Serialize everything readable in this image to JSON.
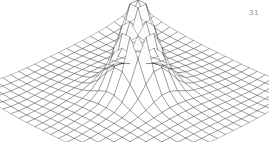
{
  "page": {
    "number": "31",
    "background_color": "#ffffff"
  },
  "figure": {
    "caption": "",
    "line_color": "#1a1a1a",
    "surface_fill": "#ffffff"
  },
  "chart_data": {
    "type": "surface",
    "title": "",
    "subtitle": "",
    "xlabel": "",
    "ylabel": "",
    "zlabel": "",
    "grid": true,
    "legend": null,
    "legend_position": "none",
    "mesh": {
      "nx": 22,
      "ny": 22,
      "xlim": [
        -1,
        1
      ],
      "ylim": [
        -1,
        1
      ],
      "zlim": [
        0,
        1
      ]
    },
    "surface_function": {
      "form": "z = peak_amplitude * exp(-(x^2 + y^2) / (2 * sigma^2)) + saddle_amplitude * (x^2 + y^2) * 0.5 * (1 - (x^2+y^2)) ",
      "peak_amplitude": 1.0,
      "sigma": 0.16,
      "saddle_amplitude": -0.18,
      "peak_center": [
        0,
        0
      ],
      "peak_height": 1.0,
      "base_height": 0.0
    },
    "projection": {
      "type": "oblique-perspective",
      "azimuth_deg": 45,
      "elevation_deg": 24,
      "scale_x": 118,
      "scale_y": 58,
      "scale_z": 92,
      "origin_x": 138,
      "origin_y": 88
    },
    "x": [
      -1,
      -0.9091,
      -0.8182,
      -0.7273,
      -0.6364,
      -0.5455,
      -0.4545,
      -0.3636,
      -0.2727,
      -0.1818,
      -0.0909,
      0,
      0.0909,
      0.1818,
      0.2727,
      0.3636,
      0.4545,
      0.5455,
      0.6364,
      0.7273,
      0.8182,
      0.9091,
      1
    ],
    "y": [
      -1,
      -0.9091,
      -0.8182,
      -0.7273,
      -0.6364,
      -0.5455,
      -0.4545,
      -0.3636,
      -0.2727,
      -0.1818,
      -0.0909,
      0,
      0.0909,
      0.1818,
      0.2727,
      0.3636,
      0.4545,
      0.5455,
      0.6364,
      0.7273,
      0.8182,
      0.9091,
      1
    ],
    "z_samples_center_row": [
      0.0,
      0.0,
      0.0,
      0.0,
      0.001,
      0.004,
      0.02,
      0.08,
      0.25,
      0.6,
      0.92,
      1.0,
      0.92,
      0.6,
      0.25,
      0.08,
      0.02,
      0.004,
      0.001,
      0.0,
      0.0,
      0.0,
      0.0
    ],
    "annotations": []
  }
}
